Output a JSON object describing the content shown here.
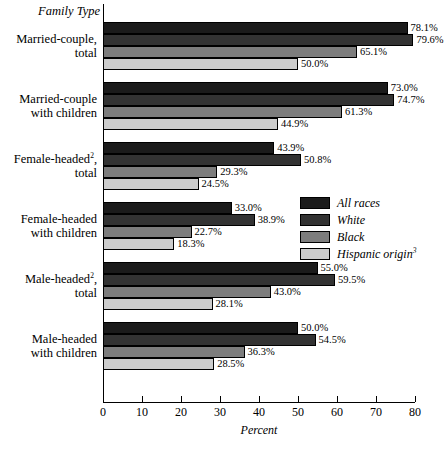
{
  "chart_data": {
    "type": "bar",
    "orientation": "horizontal",
    "title": "",
    "xlabel": "Percent",
    "ylabel": "Family Type",
    "xlim": [
      0,
      80
    ],
    "xticks": [
      0,
      10,
      20,
      30,
      40,
      50,
      60,
      70,
      80
    ],
    "xtick_labels": [
      "0",
      "10",
      "20",
      "30",
      "40",
      "50",
      "60",
      "70",
      "80"
    ],
    "grid": false,
    "legend_position": "center-right",
    "categories": [
      "Married-couple, total",
      "Married-couple with children",
      "Female-headed², total",
      "Female-headed with children",
      "Male-headed², total",
      "Male-headed with children"
    ],
    "series": [
      {
        "name": "All races",
        "color": "#1b1b1b",
        "values": [
          78.1,
          73.0,
          43.9,
          33.0,
          55.0,
          50.0
        ]
      },
      {
        "name": "White",
        "color": "#333333",
        "values": [
          79.6,
          74.7,
          50.8,
          38.9,
          59.5,
          54.5
        ]
      },
      {
        "name": "Black",
        "color": "#7d7d7d",
        "values": [
          65.1,
          61.3,
          29.3,
          22.7,
          43.0,
          36.3
        ]
      },
      {
        "name": "Hispanic origin³",
        "color": "#cccccc",
        "values": [
          50.0,
          44.9,
          24.5,
          18.3,
          28.1,
          28.5
        ]
      }
    ],
    "value_labels": [
      [
        "78.1%",
        "73.0%",
        "43.9%",
        "33.0%",
        "55.0%",
        "50.0%"
      ],
      [
        "79.6%",
        "74.7%",
        "50.8%",
        "38.9%",
        "59.5%",
        "54.5%"
      ],
      [
        "65.1%",
        "61.3%",
        "29.3%",
        "22.7%",
        "43.0%",
        "36.3%"
      ],
      [
        "50.0%",
        "44.9%",
        "24.5%",
        "18.3%",
        "28.1%",
        "28.5%"
      ]
    ]
  },
  "axis": {
    "y_title": "Family Type",
    "x_title": "Percent"
  },
  "categories": [
    {
      "line1": "Married-couple,",
      "line2": "total",
      "sup": ""
    },
    {
      "line1": "Married-couple",
      "line2": "with children",
      "sup": ""
    },
    {
      "line1": "Female-headed",
      "line2": "total",
      "sup": "2",
      "line1_suffix": ","
    },
    {
      "line1": "Female-headed",
      "line2": "with children",
      "sup": ""
    },
    {
      "line1": "Male-headed",
      "line2": "total",
      "sup": "2",
      "line1_suffix": ","
    },
    {
      "line1": "Male-headed",
      "line2": "with children",
      "sup": ""
    }
  ],
  "legend": {
    "items": [
      {
        "label": "All races",
        "sup": ""
      },
      {
        "label": "White",
        "sup": ""
      },
      {
        "label": "Black",
        "sup": ""
      },
      {
        "label": "Hispanic origin",
        "sup": "3"
      }
    ]
  }
}
